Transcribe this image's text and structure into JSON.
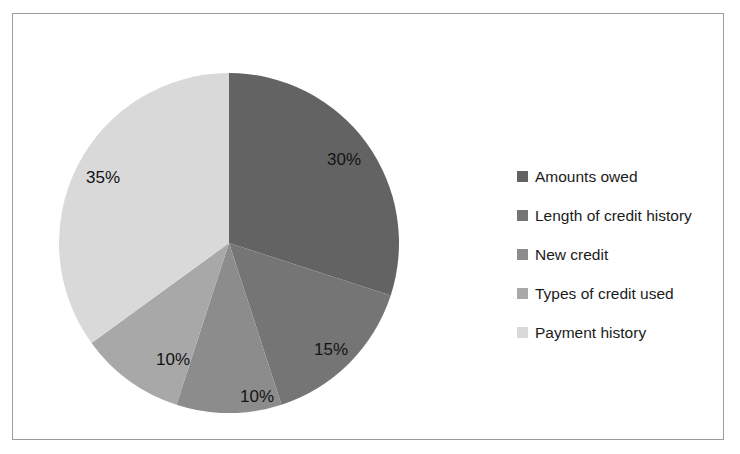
{
  "chart_data": {
    "type": "pie",
    "title": "",
    "labels": [
      "Amounts owed",
      "Length of credit history",
      "New credit",
      "Types of credit used",
      "Payment history"
    ],
    "values": [
      30,
      15,
      10,
      10,
      35
    ],
    "data_labels": [
      "30%",
      "15%",
      "10%",
      "10%",
      "35%"
    ],
    "colors": [
      "#636363",
      "#757575",
      "#8c8c8c",
      "#a8a8a8",
      "#d9d9d9"
    ],
    "units": "percent",
    "start_angle_deg": 0,
    "direction": "clockwise",
    "legend_position": "right",
    "grid": false,
    "xlabel": "",
    "ylabel": ""
  },
  "frame": {
    "border_color": "#9d9d9d",
    "background": "#ffffff"
  },
  "legend": {
    "items": [
      {
        "label": "Amounts owed",
        "color": "#636363"
      },
      {
        "label": "Length of credit history",
        "color": "#757575"
      },
      {
        "label": "New credit",
        "color": "#8c8c8c"
      },
      {
        "label": "Types of credit used",
        "color": "#a8a8a8"
      },
      {
        "label": "Payment history",
        "color": "#d9d9d9"
      }
    ]
  },
  "slice_labels": {
    "s0": "30%",
    "s1": "15%",
    "s2": "10%",
    "s3": "10%",
    "s4": "35%"
  }
}
